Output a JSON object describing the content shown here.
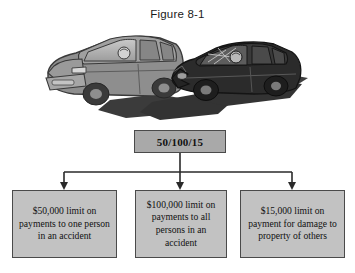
{
  "figure": {
    "title": "Figure 8-1",
    "background_color": "#ffffff"
  },
  "illustration": {
    "name": "two-car-collision-illustration",
    "description": "Gray minivan on the left collided head-on with a dark sedan on the right, both casting angular shadows",
    "vehicles": [
      {
        "name": "gray-minivan",
        "color": "#8a8a8a",
        "facing": "left"
      },
      {
        "name": "dark-sedan",
        "color": "#2b2b2b",
        "facing": "right"
      }
    ],
    "shadow_color": "#3a3a3a"
  },
  "diagram": {
    "root": {
      "label": "50/100/15",
      "fill_color": "#a9a9a9",
      "border_color": "#4a4a4a"
    },
    "leaves": [
      {
        "label": "$50,000 limit on payments to one person in an accident",
        "lines": [
          "$50,000 limit on",
          "payments to one",
          "person in an",
          "accident"
        ],
        "fill_color": "#c2c2c2"
      },
      {
        "label": "$100,000 limit on payments to all persons in an accident",
        "lines": [
          "$100,000 limit",
          "on payments to",
          "all persons in",
          "an accident"
        ],
        "fill_color": "#c2c2c2"
      },
      {
        "label": "$15,000 limit on payment for damage to property of others",
        "lines": [
          "$15,000 limit on",
          "payment for",
          "damage to",
          "property of others"
        ],
        "fill_color": "#c2c2c2"
      }
    ],
    "connector": {
      "name": "tree-connector",
      "line_color": "#2a2a2a",
      "arrow_count": 3
    }
  }
}
